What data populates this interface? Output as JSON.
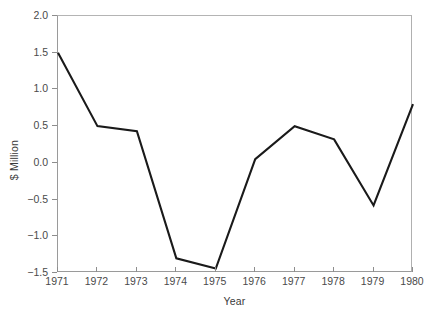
{
  "chart_data": {
    "type": "line",
    "title": "",
    "xlabel": "Year",
    "ylabel": "$ Million",
    "categories": [
      "1971",
      "1972",
      "1973",
      "1974",
      "1975",
      "1976",
      "1977",
      "1978",
      "1979",
      "1980"
    ],
    "x": [
      1971,
      1972,
      1973,
      1974,
      1975,
      1976,
      1977,
      1978,
      1979,
      1980
    ],
    "values": [
      1.5,
      0.5,
      0.43,
      -1.3,
      -1.44,
      0.05,
      0.5,
      0.32,
      -0.58,
      0.8
    ],
    "series": [
      {
        "name": "$ Million",
        "values": [
          1.5,
          0.5,
          0.43,
          -1.3,
          -1.44,
          0.05,
          0.5,
          0.32,
          -0.58,
          0.8
        ],
        "color": "#1a1a1a"
      }
    ],
    "ylim": [
      -1.5,
      2.0
    ],
    "xlim": [
      1971,
      1980
    ],
    "yticks": [
      2.0,
      1.5,
      1.0,
      0.5,
      0.0,
      -0.5,
      -1.0,
      -1.5
    ],
    "ytick_labels": [
      "2.0",
      "1.5",
      "1.0",
      "0.5",
      "0.0",
      "−0.5",
      "−1.0",
      "−1.5"
    ],
    "xticks": [
      1971,
      1972,
      1973,
      1974,
      1975,
      1976,
      1977,
      1978,
      1979,
      1980
    ],
    "xtick_labels": [
      "1971",
      "1972",
      "1973",
      "1974",
      "1975",
      "1976",
      "1977",
      "1978",
      "1979",
      "1980"
    ],
    "grid": false,
    "legend": false,
    "legend_position": "none",
    "frame_color": "#9a9a9a",
    "line_color": "#1a1a1a",
    "background": "#ffffff"
  }
}
